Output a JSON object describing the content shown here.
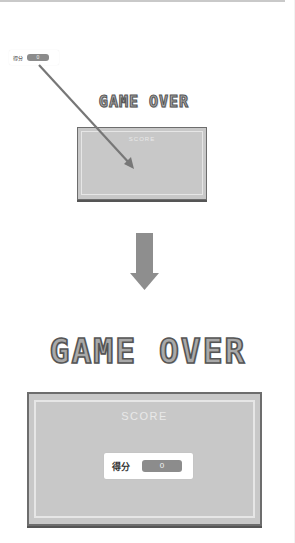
{
  "before": {
    "score_widget": {
      "label": "得分",
      "value": "0"
    },
    "title": "GAME OVER",
    "panel": {
      "heading": "SCORE"
    }
  },
  "transition": {
    "arrow": "down-arrow-icon"
  },
  "after": {
    "title": "GAME OVER",
    "panel": {
      "heading": "SCORE"
    },
    "score_widget": {
      "label": "得分",
      "value": "0"
    }
  },
  "colors": {
    "panel_fill": "#c8c8c8",
    "panel_border": "#6d6d6d",
    "value_box": "#8c8c8c",
    "arrow": "#8e8e8e",
    "pointer_line": "#777777"
  }
}
